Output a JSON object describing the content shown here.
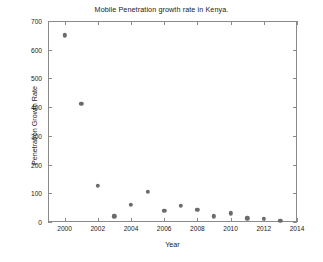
{
  "chart_data": {
    "type": "scatter",
    "title": "Mobile Penetration growth rate in Kenya.",
    "xlabel": "Year",
    "ylabel": "Penetration Growth Rate",
    "x": [
      2000,
      2001,
      2002,
      2003,
      2004,
      2005,
      2006,
      2007,
      2008,
      2009,
      2010,
      2011,
      2012,
      2013
    ],
    "values": [
      650,
      412,
      125,
      20,
      60,
      105,
      40,
      56,
      43,
      20,
      30,
      13,
      11,
      5
    ],
    "xlim": [
      1999,
      2014
    ],
    "ylim": [
      0,
      700
    ],
    "xticks": [
      2000,
      2002,
      2004,
      2006,
      2008,
      2010,
      2012,
      2014
    ],
    "yticks": [
      0,
      100,
      200,
      300,
      400,
      500,
      600,
      700
    ],
    "xtick_labels": [
      "2000",
      "2002",
      "2004",
      "2006",
      "2008",
      "2010",
      "2012",
      "2014"
    ],
    "ytick_labels": [
      "0",
      "100",
      "200",
      "300",
      "400",
      "500",
      "600",
      "700"
    ],
    "grid": false,
    "legend": null,
    "marker": "filled-circle",
    "marker_color": "#6b6b6b",
    "axis_color": "#8a8a8a",
    "background": "#ffffff"
  }
}
